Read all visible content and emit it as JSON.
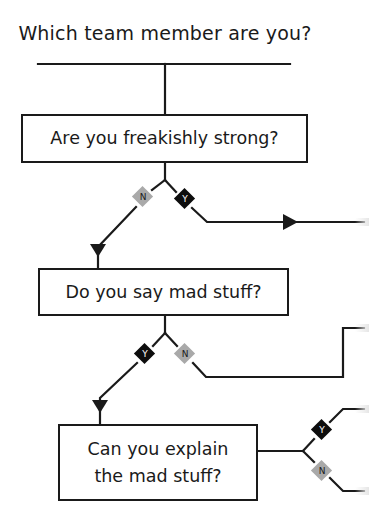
{
  "title": "Which team member are you?",
  "questions": [
    {
      "id": "q1",
      "lines": [
        "Are you freakishly strong?"
      ]
    },
    {
      "id": "q2",
      "lines": [
        "Do you say mad stuff?"
      ]
    },
    {
      "id": "q3",
      "lines": [
        "Can you explain",
        "the mad stuff?"
      ]
    }
  ],
  "branches": {
    "q1": {
      "no": "N",
      "yes": "Y"
    },
    "q2": {
      "yes": "Y",
      "no": "N"
    },
    "q3": {
      "yes": "Y",
      "no": "N"
    }
  },
  "colors": {
    "line": "#1a1a1a",
    "yes_diamond": "#0d0d0d",
    "no_diamond": "#a9a9a9",
    "background": "#ffffff"
  }
}
